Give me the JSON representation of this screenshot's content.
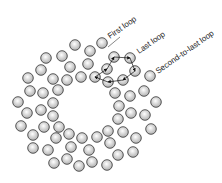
{
  "labels": {
    "first_loop": "First loop",
    "last_loop": "Last loop",
    "second_to_last_loop": "Second-to-last loop"
  },
  "colors": {
    "circle_stroke": "#333333",
    "circle_fill_center": "#ffffff",
    "circle_fill_edge": "#b0b0b0",
    "line": "#111111"
  },
  "circle_radius": 5.3,
  "circles": [
    [
      75,
      45
    ],
    [
      90,
      51
    ],
    [
      102,
      43
    ],
    [
      46,
      58
    ],
    [
      62,
      56
    ],
    [
      114,
      57
    ],
    [
      130,
      58
    ],
    [
      41,
      70
    ],
    [
      70,
      67
    ],
    [
      88,
      64
    ],
    [
      107,
      69
    ],
    [
      135,
      71
    ],
    [
      28,
      78
    ],
    [
      53,
      79
    ],
    [
      67,
      80
    ],
    [
      81,
      77
    ],
    [
      95,
      77
    ],
    [
      108,
      82
    ],
    [
      123,
      80
    ],
    [
      150,
      76
    ],
    [
      30,
      91
    ],
    [
      43,
      93
    ],
    [
      58,
      90
    ],
    [
      115,
      93
    ],
    [
      130,
      96
    ],
    [
      144,
      91
    ],
    [
      18,
      102
    ],
    [
      53,
      103
    ],
    [
      119,
      106
    ],
    [
      156,
      102
    ],
    [
      27,
      113
    ],
    [
      41,
      110
    ],
    [
      53,
      116
    ],
    [
      131,
      113
    ],
    [
      145,
      115
    ],
    [
      21,
      126
    ],
    [
      44,
      127
    ],
    [
      59,
      127
    ],
    [
      118,
      119
    ],
    [
      151,
      129
    ],
    [
      33,
      135
    ],
    [
      69,
      134
    ],
    [
      82,
      138
    ],
    [
      97,
      137
    ],
    [
      108,
      131
    ],
    [
      123,
      132
    ],
    [
      56,
      138
    ],
    [
      33,
      148
    ],
    [
      48,
      150
    ],
    [
      71,
      147
    ],
    [
      89,
      150
    ],
    [
      110,
      143
    ],
    [
      136,
      138
    ],
    [
      54,
      163
    ],
    [
      67,
      159
    ],
    [
      79,
      166
    ],
    [
      92,
      162
    ],
    [
      107,
      165
    ],
    [
      118,
      155
    ],
    [
      133,
      152
    ]
  ],
  "loop_path": [
    [
      95,
      77
    ],
    [
      107,
      69
    ],
    [
      114,
      57
    ],
    [
      130,
      58
    ],
    [
      135,
      71
    ],
    [
      123,
      80
    ],
    [
      108,
      82
    ],
    [
      95,
      77
    ]
  ]
}
